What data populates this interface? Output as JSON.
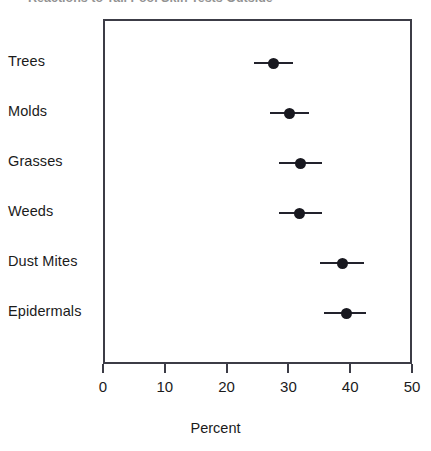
{
  "figure": {
    "title_clipped": "Reactions to Tall Pool Skin Tests Outside",
    "x_axis_label": "Percent"
  },
  "chart_data": {
    "type": "scatter",
    "orientation": "horizontal",
    "title": "",
    "xlabel": "Percent",
    "ylabel": "",
    "xlim": [
      0,
      50
    ],
    "xticks": [
      0,
      10,
      20,
      30,
      40,
      50
    ],
    "xtick_labels": [
      "0",
      "10",
      "20",
      "30",
      "40",
      "50"
    ],
    "grid": false,
    "legend": false,
    "error_bars": "horizontal 95% confidence interval",
    "categories": [
      "Trees",
      "Molds",
      "Grasses",
      "Weeds",
      "Dust Mites",
      "Epidermals"
    ],
    "values": [
      27.3,
      29.9,
      31.6,
      31.5,
      38.4,
      39.0
    ],
    "ci_low": [
      24.1,
      26.7,
      28.2,
      28.2,
      34.8,
      35.4
    ],
    "ci_high": [
      30.4,
      33.0,
      35.1,
      35.1,
      41.9,
      42.2
    ],
    "points": [
      {
        "category": "Trees",
        "value": 27.3,
        "ci_low": 24.1,
        "ci_high": 30.4
      },
      {
        "category": "Molds",
        "value": 29.9,
        "ci_low": 26.7,
        "ci_high": 33.0
      },
      {
        "category": "Grasses",
        "value": 31.6,
        "ci_low": 28.2,
        "ci_high": 35.1
      },
      {
        "category": "Weeds",
        "value": 31.5,
        "ci_low": 28.2,
        "ci_high": 35.1
      },
      {
        "category": "Dust Mites",
        "value": 38.4,
        "ci_low": 34.8,
        "ci_high": 41.9
      },
      {
        "category": "Epidermals",
        "value": 39.0,
        "ci_low": 35.4,
        "ci_high": 42.2
      }
    ],
    "colors": {
      "marker": "#18181f",
      "error_bar": "#22222c",
      "axis": "#3c3c46",
      "background": "#ffffff"
    }
  }
}
